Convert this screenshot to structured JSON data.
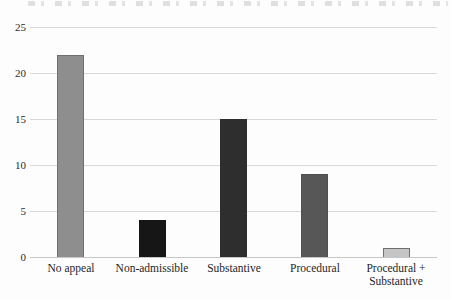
{
  "chart_data": {
    "type": "bar",
    "title": "",
    "xlabel": "",
    "ylabel": "",
    "categories": [
      "No appeal",
      "Non-admissible",
      "Substantive",
      "Procedural",
      "Procedural + Substantive"
    ],
    "values": [
      22,
      4,
      15,
      9,
      1
    ],
    "bar_fill_colors": [
      "#8e8e8e",
      "#161616",
      "#2e2e2e",
      "#575757",
      "#c4c4c4"
    ],
    "bar_border_colors": [
      "#6f6f6f",
      "#161616",
      "#2e2e2e",
      "#4f4f4f",
      "#6f6f6f"
    ],
    "yticks": [
      0,
      5,
      10,
      15,
      20,
      25
    ],
    "ylim": [
      0,
      25
    ],
    "grid": true,
    "gridline_color": "#d9d9d9",
    "baseline_color": "#c7c7c7",
    "text_color": "#2b2b2b",
    "background_color": "#fdfdfd",
    "legend": null,
    "clipped_caption_remnant": true
  }
}
